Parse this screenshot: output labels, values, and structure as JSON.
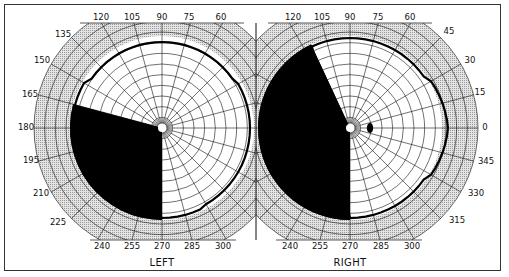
{
  "figure": {
    "colors": {
      "background": "#ffffff",
      "frame": "#333333",
      "band": "#d6d6d6",
      "grid": "#111111",
      "defect": "#000000",
      "isopter": "#000000"
    }
  },
  "chart_data": [
    {
      "type": "polar",
      "eye": "LEFT",
      "center": [
        162,
        128
      ],
      "meridian_labels": [
        "0",
        "15",
        "30",
        "45",
        "60",
        "75",
        "90",
        "105",
        "120",
        "135",
        "150",
        "165",
        "180",
        "195",
        "210",
        "225",
        "240",
        "255",
        "270",
        "285",
        "300",
        "315",
        "330",
        "345"
      ],
      "visible_meridian_labels": [
        "120",
        "105",
        "90",
        "75",
        "60",
        "135",
        "150",
        "165",
        "180",
        "195",
        "210",
        "225",
        "240",
        "255",
        "270",
        "285",
        "300"
      ],
      "ring_step_deg": 10,
      "isopter": "near-complete peripheral field, nasal-right side traced to ~85 degrees temporally",
      "defect": {
        "description": "Dense scotoma filling lower-left (temporal inferior) quadrant from ~165 to 270 degrees",
        "from_deg": 165,
        "to_deg": 270
      }
    },
    {
      "type": "polar",
      "eye": "RIGHT",
      "center": [
        350,
        128
      ],
      "visible_meridian_labels": [
        "120",
        "105",
        "90",
        "75",
        "60",
        "45",
        "30",
        "15",
        "0",
        "345",
        "330",
        "315",
        "240",
        "255",
        "270",
        "285",
        "300"
      ],
      "ring_step_deg": 10,
      "isopter": "full temporal field extending to ~95 degrees at 0",
      "defect": {
        "description": "Dense scotoma filling left hemifield from ~115 to 270 degrees",
        "from_deg": 115,
        "to_deg": 270
      },
      "blind_spot": {
        "angle_deg": 0,
        "eccentricity": 15
      }
    }
  ],
  "labels": {
    "left_eye": "LEFT",
    "right_eye": "RIGHT"
  },
  "left": {
    "ticks": [
      {
        "t": "120",
        "x": 101,
        "y": 20
      },
      {
        "t": "105",
        "x": 132,
        "y": 20
      },
      {
        "t": "90",
        "x": 162,
        "y": 20
      },
      {
        "t": "75",
        "x": 189,
        "y": 20
      },
      {
        "t": "60",
        "x": 221,
        "y": 20
      },
      {
        "t": "135",
        "x": 63,
        "y": 37
      },
      {
        "t": "150",
        "x": 42,
        "y": 63
      },
      {
        "t": "165",
        "x": 30,
        "y": 97
      },
      {
        "t": "180",
        "x": 26,
        "y": 130
      },
      {
        "t": "195",
        "x": 31,
        "y": 163
      },
      {
        "t": "210",
        "x": 41,
        "y": 196
      },
      {
        "t": "225",
        "x": 58,
        "y": 225
      },
      {
        "t": "240",
        "x": 102,
        "y": 249
      },
      {
        "t": "255",
        "x": 132,
        "y": 249
      },
      {
        "t": "270",
        "x": 162,
        "y": 249
      },
      {
        "t": "285",
        "x": 192,
        "y": 249
      },
      {
        "t": "300",
        "x": 223,
        "y": 249
      }
    ]
  },
  "right": {
    "ticks": [
      {
        "t": "120",
        "x": 293,
        "y": 20
      },
      {
        "t": "105",
        "x": 322,
        "y": 20
      },
      {
        "t": "90",
        "x": 350,
        "y": 20
      },
      {
        "t": "75",
        "x": 378,
        "y": 20
      },
      {
        "t": "60",
        "x": 410,
        "y": 20
      },
      {
        "t": "45",
        "x": 449,
        "y": 34
      },
      {
        "t": "30",
        "x": 470,
        "y": 63
      },
      {
        "t": "15",
        "x": 480,
        "y": 95
      },
      {
        "t": "0",
        "x": 485,
        "y": 130
      },
      {
        "t": "345",
        "x": 486,
        "y": 164
      },
      {
        "t": "330",
        "x": 476,
        "y": 196
      },
      {
        "t": "315",
        "x": 457,
        "y": 223
      },
      {
        "t": "240",
        "x": 290,
        "y": 249
      },
      {
        "t": "255",
        "x": 320,
        "y": 249
      },
      {
        "t": "270",
        "x": 350,
        "y": 249
      },
      {
        "t": "285",
        "x": 381,
        "y": 249
      },
      {
        "t": "300",
        "x": 412,
        "y": 249
      }
    ]
  }
}
